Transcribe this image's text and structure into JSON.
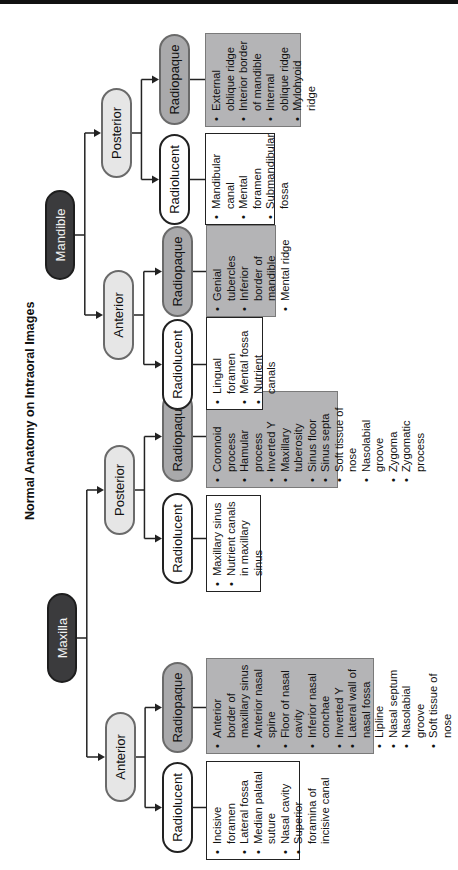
{
  "title": "Normal Anatomy on Intraoral Images",
  "maxilla": {
    "label": "Maxilla",
    "anterior": {
      "label": "Anterior",
      "radiolucent": {
        "label": "Radiolucent",
        "items": [
          "Incisive foramen",
          "Lateral fossa",
          "Median palatal suture",
          "Nasal cavity",
          "Superior foramina of incisive canal"
        ]
      },
      "radiopaque": {
        "label": "Radiopaque",
        "items": [
          "Anterior border of maxillary sinus",
          "Anterior nasal spine",
          "Floor of nasal cavity",
          "Inferior nasal conchae",
          "Inverted Y",
          "Lateral wall of nasal fossa",
          "Lipline",
          "Nasal septum",
          "Nasolabial groove",
          "Soft tissue of nose"
        ]
      }
    },
    "posterior": {
      "label": "Posterior",
      "radiolucent": {
        "label": "Radiolucent",
        "items": [
          "Maxillary sinus",
          "Nutrient canals in maxillary sinus"
        ]
      },
      "radiopaque": {
        "label": "Radiopaque",
        "items": [
          "Coronoid process",
          "Hamular process",
          "Inverted Y",
          "Maxillary tuberosity",
          "Sinus floor",
          "Sinus septa",
          "Soft tissue of nose",
          "Nasolabial groove",
          "Zygoma",
          "Zygomatic process"
        ]
      }
    }
  },
  "mandible": {
    "label": "Mandible",
    "anterior": {
      "label": "Anterior",
      "radiolucent": {
        "label": "Radiolucent",
        "items": [
          "Lingual foramen",
          "Mental fossa",
          "Nutrient canals"
        ]
      },
      "radiopaque": {
        "label": "Radiopaque",
        "items": [
          "Genial tubercles",
          "Inferior border of mandible",
          "Mental ridge"
        ]
      }
    },
    "posterior": {
      "label": "Posterior",
      "radiolucent": {
        "label": "Radiolucent",
        "items": [
          "Mandibular canal",
          "Mental foramen",
          "Submandibular fossa"
        ]
      },
      "radiopaque": {
        "label": "Radiopaque",
        "items": [
          "External oblique ridge",
          "Interior border of mandible",
          "Internal oblique ridge",
          "Mylohyoid ridge"
        ]
      }
    }
  }
}
